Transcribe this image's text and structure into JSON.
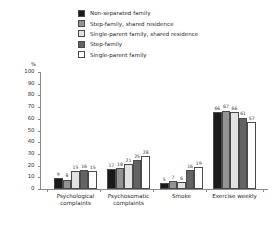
{
  "chart_data": {
    "type": "bar",
    "title": "",
    "subtitle": "",
    "xlabel": "",
    "ylabel": "%",
    "ylim": [
      0,
      100
    ],
    "ytick_labels": [
      "100",
      "90",
      "80",
      "70",
      "60",
      "50",
      "40",
      "30",
      "20",
      "10",
      "0"
    ],
    "ytick_values": [
      100,
      90,
      80,
      70,
      60,
      50,
      40,
      30,
      20,
      10,
      0
    ],
    "grid": false,
    "legend_position": "top",
    "categories": [
      "Psychological complaints",
      "Psychosomatic complaints",
      "Smoke",
      "Exercise weekly"
    ],
    "series": [
      {
        "name": "Non-separated family",
        "color": "#1a1a1a",
        "values": [
          9,
          17,
          5,
          66
        ]
      },
      {
        "name": "Step-family, shared residence",
        "color": "#939393",
        "values": [
          8,
          18,
          7,
          67
        ]
      },
      {
        "name": "Single-parent family, shared residence",
        "color": "#e2e2e2",
        "values": [
          15,
          21,
          6,
          66
        ]
      },
      {
        "name": "Step-family",
        "color": "#636363",
        "values": [
          16,
          25,
          16,
          61
        ]
      },
      {
        "name": "Single-parent family",
        "color": "#ffffff",
        "values": [
          15,
          28,
          19,
          57
        ]
      }
    ]
  }
}
